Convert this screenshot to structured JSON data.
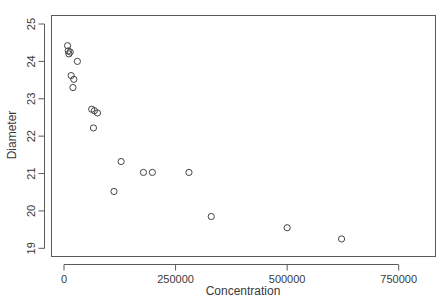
{
  "chart_data": {
    "type": "scatter",
    "title": "",
    "xlabel": "Concentration",
    "ylabel": "Diameter",
    "xlim": [
      -20000,
      835000
    ],
    "ylim": [
      18.78,
      25.28
    ],
    "grid": false,
    "legend": false,
    "marker": "open-circle",
    "x_ticks": [
      0,
      250000,
      500000,
      750000
    ],
    "x_tick_labels": [
      "0",
      "250000",
      "500000",
      "750000"
    ],
    "y_ticks": [
      19,
      20,
      21,
      22,
      23,
      24,
      25
    ],
    "y_tick_labels": [
      "19",
      "20",
      "21",
      "22",
      "23",
      "24",
      "25"
    ],
    "points": [
      {
        "x": 8000,
        "y": 24.42
      },
      {
        "x": 9500,
        "y": 24.28
      },
      {
        "x": 11000,
        "y": 24.2
      },
      {
        "x": 14000,
        "y": 24.25
      },
      {
        "x": 30000,
        "y": 24.0
      },
      {
        "x": 16000,
        "y": 23.62
      },
      {
        "x": 22000,
        "y": 23.52
      },
      {
        "x": 20000,
        "y": 23.3
      },
      {
        "x": 62000,
        "y": 22.72
      },
      {
        "x": 68000,
        "y": 22.68
      },
      {
        "x": 75000,
        "y": 22.62
      },
      {
        "x": 66000,
        "y": 22.22
      },
      {
        "x": 128000,
        "y": 21.32
      },
      {
        "x": 178000,
        "y": 21.03
      },
      {
        "x": 198000,
        "y": 21.03
      },
      {
        "x": 280000,
        "y": 21.03
      },
      {
        "x": 112000,
        "y": 20.52
      },
      {
        "x": 330000,
        "y": 19.85
      },
      {
        "x": 500000,
        "y": 19.55
      },
      {
        "x": 622000,
        "y": 19.25
      }
    ]
  },
  "axes": {
    "x_title": "Concentration",
    "y_title": "Diameter"
  }
}
